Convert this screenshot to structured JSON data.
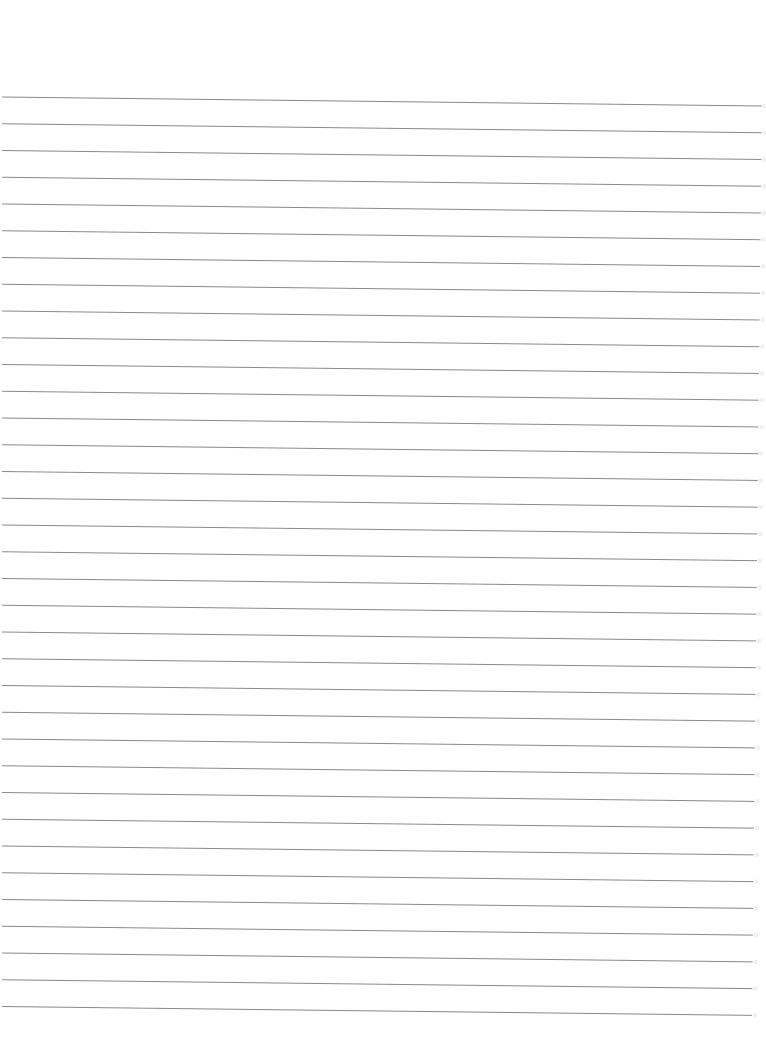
{
  "page": {
    "type": "blank lined paper",
    "background_color": "#ffffff",
    "line_color": "#8a8a8a",
    "line_count": 35,
    "first_line_y_left": 97,
    "first_line_y_right": 106,
    "line_spacing": 26.75,
    "line_start_x": 2,
    "line_end_x_top": 762,
    "line_end_x_bottom": 752,
    "text_content": []
  }
}
